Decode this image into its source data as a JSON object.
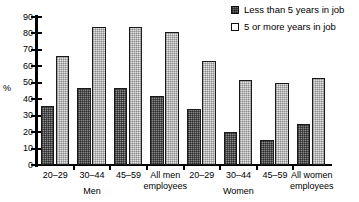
{
  "chart_data": {
    "type": "bar",
    "title": "",
    "xlabel": "",
    "ylabel": "%",
    "ylim": [
      0,
      90
    ],
    "yticks": [
      0,
      10,
      20,
      30,
      40,
      50,
      60,
      70,
      80,
      90
    ],
    "grid": false,
    "legend_position": "top-right",
    "categories": [
      "20–29",
      "30–44",
      "45–59",
      "All men\nemployees",
      "20–29",
      "30–44",
      "45–59",
      "All women\nemployees"
    ],
    "group_labels": [
      "Men",
      "Women"
    ],
    "series": [
      {
        "name": "Less than 5 years in job",
        "color": "#8a8a8a",
        "values": [
          36,
          47,
          47,
          42,
          34,
          20,
          15,
          25
        ]
      },
      {
        "name": "5 or more years in job",
        "color": "#e2e2e2",
        "values": [
          66,
          84,
          84,
          81,
          63,
          52,
          50,
          53
        ]
      }
    ]
  },
  "axis": {
    "y_unit_label": "%",
    "tick_labels": [
      "90",
      "80",
      "70",
      "60",
      "50",
      "40",
      "30",
      "20",
      "10",
      "0"
    ]
  },
  "legend": {
    "items": [
      {
        "label": "Less than 5 years in job",
        "swatch": "dark-dotted-square"
      },
      {
        "label": "5 or more years in job",
        "swatch": "light-outline-square"
      }
    ]
  },
  "xaxis": {
    "tick_labels": [
      "20–29",
      "30–44",
      "45–59",
      "All men\nemployees",
      "20–29",
      "30–44",
      "45–59",
      "All women\nemployees"
    ],
    "group_labels": [
      "Men",
      "Women"
    ]
  }
}
